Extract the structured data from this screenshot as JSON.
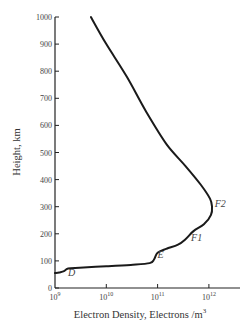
{
  "chart_data": {
    "type": "line",
    "title": "",
    "xlabel": "Electron Density, Electrons /m³",
    "ylabel": "Height, km",
    "x_scale": "log",
    "xlim": [
      1000000000.0,
      5000000000000.0
    ],
    "ylim": [
      0,
      1000
    ],
    "grid": false,
    "x_ticks": [
      {
        "value": 1000000000.0,
        "label_base": "10",
        "label_exp": "9"
      },
      {
        "value": 10000000000.0,
        "label_base": "10",
        "label_exp": "10"
      },
      {
        "value": 100000000000.0,
        "label_base": "10",
        "label_exp": "11"
      },
      {
        "value": 1000000000000.0,
        "label_base": "10",
        "label_exp": "12"
      }
    ],
    "y_ticks": [
      0,
      100,
      200,
      300,
      400,
      500,
      600,
      700,
      800,
      900,
      1000
    ],
    "series": [
      {
        "name": "Electron density profile",
        "points": [
          {
            "density": 1000000000.0,
            "height": 55
          },
          {
            "density": 1200000000.0,
            "height": 57
          },
          {
            "density": 1500000000.0,
            "height": 62
          },
          {
            "density": 1800000000.0,
            "height": 72
          },
          {
            "density": 3000000000.0,
            "height": 75
          },
          {
            "density": 10000000000.0,
            "height": 80
          },
          {
            "density": 30000000000.0,
            "height": 85
          },
          {
            "density": 70000000000.0,
            "height": 92
          },
          {
            "density": 85000000000.0,
            "height": 105
          },
          {
            "density": 100000000000.0,
            "height": 130
          },
          {
            "density": 150000000000.0,
            "height": 145
          },
          {
            "density": 250000000000.0,
            "height": 160
          },
          {
            "density": 350000000000.0,
            "height": 180
          },
          {
            "density": 500000000000.0,
            "height": 210
          },
          {
            "density": 800000000000.0,
            "height": 235
          },
          {
            "density": 1100000000000.0,
            "height": 270
          },
          {
            "density": 1150000000000.0,
            "height": 300
          },
          {
            "density": 1050000000000.0,
            "height": 330
          },
          {
            "density": 700000000000.0,
            "height": 380
          },
          {
            "density": 350000000000.0,
            "height": 450
          },
          {
            "density": 150000000000.0,
            "height": 530
          },
          {
            "density": 60000000000.0,
            "height": 650
          },
          {
            "density": 25000000000.0,
            "height": 780
          },
          {
            "density": 10000000000.0,
            "height": 900
          },
          {
            "density": 5000000000.0,
            "height": 1000
          }
        ]
      }
    ],
    "annotations": [
      {
        "text": "D",
        "density": 1800000000.0,
        "height": 45
      },
      {
        "text": "E",
        "density": 100000000000.0,
        "height": 110
      },
      {
        "text": "F1",
        "density": 450000000000.0,
        "height": 175
      },
      {
        "text": "F2",
        "density": 1300000000000.0,
        "height": 300
      }
    ]
  }
}
